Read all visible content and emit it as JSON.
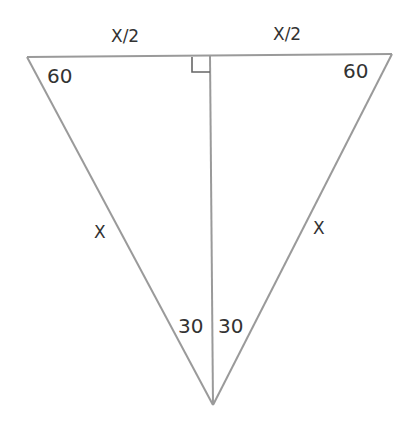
{
  "diagram": {
    "type": "geometry",
    "colors": {
      "line": "#9a9a9a",
      "text": "#333333",
      "background": "#ffffff"
    },
    "vertices": {
      "top_left": [
        27,
        57
      ],
      "top_right": [
        392,
        54
      ],
      "bottom": [
        213,
        405
      ],
      "top_mid": [
        210,
        56
      ]
    },
    "labels": {
      "top_left_half": "X/2",
      "top_right_half": "X/2",
      "left_side": "X",
      "right_side": "X",
      "angle_top_left": "60",
      "angle_top_right": "60",
      "angle_bottom_left": "30",
      "angle_bottom_right": "30"
    },
    "right_angle_marker": true
  }
}
